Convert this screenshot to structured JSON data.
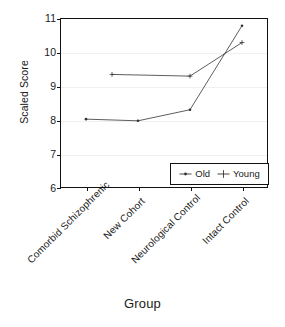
{
  "chart_data": {
    "type": "line",
    "title": "",
    "xlabel": "Group",
    "ylabel": "Scaled Score",
    "categories": [
      "Comorbid Schizophrenic",
      "New Cohort",
      "Neurological Control",
      "Intact Control"
    ],
    "series": [
      {
        "name": "Old",
        "marker": "dot",
        "values": [
          8.02,
          7.97,
          8.3,
          10.8
        ]
      },
      {
        "name": "Young",
        "marker": "plus",
        "values": [
          null,
          9.35,
          9.3,
          10.3
        ]
      }
    ],
    "young_first_point_note": "Young series begins plotted between category 1 and 2 at 9.35",
    "ylim": [
      6,
      11
    ],
    "yticks": [
      6,
      7,
      8,
      9,
      10,
      11
    ],
    "ytick_labels": [
      "6",
      "7",
      "8",
      "9",
      "10",
      "11"
    ],
    "grid": true,
    "grid_axis": "y",
    "legend_position": "bottom-right",
    "line_color": "#333333",
    "frame_color": "#111111",
    "grid_color": "#f0f0f0"
  },
  "axes": {
    "y_title": "Scaled Score",
    "x_title": "Group",
    "y_tick_labels": [
      "11",
      "10",
      "9",
      "8",
      "7",
      "6"
    ],
    "x_tick_labels": [
      "Comorbid Schizophrenic",
      "New Cohort",
      "Neurological Control",
      "Intact Control"
    ]
  },
  "legend": {
    "entries": [
      {
        "label": "Old",
        "marker": "dot"
      },
      {
        "label": "Young",
        "marker": "plus"
      }
    ]
  }
}
